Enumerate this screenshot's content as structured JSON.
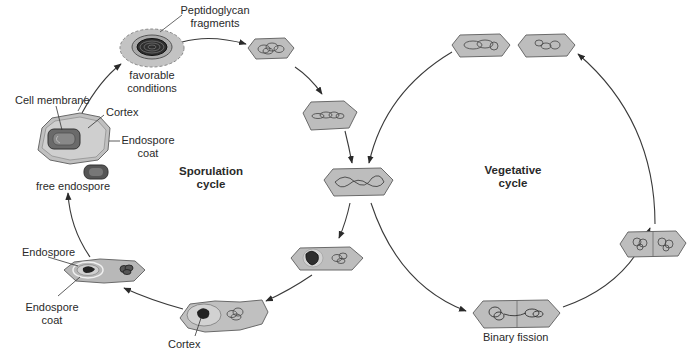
{
  "diagram": {
    "type": "bacterial life cycle",
    "colors": {
      "cell_fill": "#b9b9b9",
      "cell_outline": "#6e6e6e",
      "cell_inner": "#cfcfcf",
      "spore_dark": "#3a3a3a",
      "arrow": "#333333",
      "text": "#2a2a2a"
    },
    "cycles": [
      {
        "name": "sporulation",
        "label_line1": "Sporulation",
        "label_line2": "cycle"
      },
      {
        "name": "vegetative",
        "label_line1": "Vegetative",
        "label_line2": "cycle"
      }
    ],
    "labels": {
      "peptidoglycan_line1": "Peptidoglycan",
      "peptidoglycan_line2": "fragments",
      "favorable_line1": "favorable",
      "favorable_line2": "conditions",
      "cell_membrane": "Cell membrane",
      "cortex_top": "Cortex",
      "endospore_coat_top_line1": "Endospore",
      "endospore_coat_top_line2": "coat",
      "free_endospore": "free endospore",
      "endospore": "Endospore",
      "endospore_coat_bottom_line1": "Endospore",
      "endospore_coat_bottom_line2": "coat",
      "cortex_bottom": "Cortex",
      "binary_fission": "Binary fission"
    },
    "stages": [
      "germinating spore (favorable conditions)",
      "vegetative cell 1",
      "vegetative cell 2",
      "vegetative cell (branch point)",
      "forespore formation",
      "cortex formation",
      "endospore coat formation",
      "mature endospore in cell",
      "free endospore",
      "binary fission",
      "dividing cells",
      "daughter cells"
    ]
  }
}
